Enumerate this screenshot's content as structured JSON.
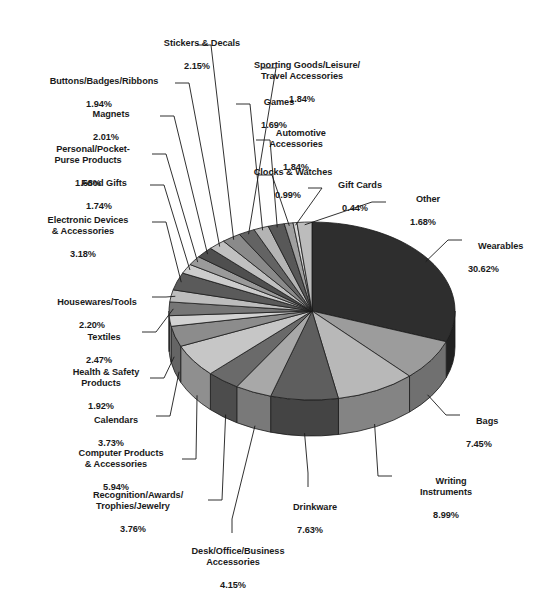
{
  "chart_data": {
    "type": "pie",
    "title": "",
    "subtitle": "",
    "xlabel": "",
    "ylabel": "",
    "legend_position": "none",
    "grid": false,
    "units": "percent",
    "start_angle_deg": 0,
    "direction": "clockwise",
    "three_d": true,
    "categories": [
      "Wearables",
      "Bags",
      "Writing Instruments",
      "Drinkware",
      "Desk/Office/Business Accessories",
      "Recognition/Awards/Trophies/Jewelry",
      "Computer Products & Accessories",
      "Calendars",
      "Health & Safety Products",
      "Textiles",
      "Housewares/Tools",
      "Electronic Devices & Accessories",
      "Food Gifts",
      "Personal/Pocket-Purse Products",
      "Magnets",
      "Buttons/Badges/Ribbons",
      "Stickers & Decals",
      "Sporting Goods/Leisure/Travel Accessories",
      "Games",
      "Automotive Accessories",
      "Clocks & Watches",
      "Gift Cards",
      "Other"
    ],
    "values": [
      30.62,
      7.45,
      8.99,
      7.63,
      4.15,
      3.76,
      5.94,
      3.73,
      1.92,
      2.47,
      2.2,
      3.18,
      1.74,
      1.68,
      2.01,
      1.94,
      2.15,
      1.84,
      1.69,
      1.84,
      0.99,
      0.44,
      1.68
    ],
    "colors": [
      "#2e2e2e",
      "#9c9c9c",
      "#b8b8b8",
      "#5e5e5e",
      "#a8a8a8",
      "#6a6a6a",
      "#c6c6c6",
      "#8c8c8c",
      "#d2d2d2",
      "#767676",
      "#bdbdbd",
      "#5a5a5a",
      "#cccccc",
      "#9a9a9a",
      "#4f4f4f",
      "#c0c0c0",
      "#8a8a8a",
      "#636363",
      "#b4b4b4",
      "#585858",
      "#a0a0a0",
      "#d6d6d6",
      "#bcbcbc"
    ]
  },
  "labels": [
    {
      "name": "stickers-decals",
      "title": "Stickers & Decals",
      "pct": "2.15%"
    },
    {
      "name": "sporting-goods",
      "title": "Sporting Goods/Leisure/\nTravel Accessories",
      "pct": "1.84%"
    },
    {
      "name": "buttons-badges",
      "title": "Buttons/Badges/Ribbons",
      "pct": "1.94%"
    },
    {
      "name": "games",
      "title": "Games",
      "pct": "1.69%"
    },
    {
      "name": "magnets",
      "title": "Magnets",
      "pct": "2.01%"
    },
    {
      "name": "automotive",
      "title": "Automotive\nAccessories",
      "pct": "1.84%"
    },
    {
      "name": "personal-pocket",
      "title": "Personal/Pocket-\nPurse Products",
      "pct": "1.68%"
    },
    {
      "name": "clocks-watches",
      "title": "Clocks & Watches",
      "pct": "0.99%"
    },
    {
      "name": "gift-cards",
      "title": "Gift Cards",
      "pct": "0.44%"
    },
    {
      "name": "other",
      "title": "Other",
      "pct": "1.68%"
    },
    {
      "name": "food-gifts",
      "title": "Food Gifts",
      "pct": "1.74%"
    },
    {
      "name": "electronic-devices",
      "title": "Electronic Devices\n& Accessories",
      "pct": "3.18%"
    },
    {
      "name": "wearables",
      "title": "Wearables",
      "pct": "30.62%"
    },
    {
      "name": "housewares-tools",
      "title": "Housewares/Tools",
      "pct": "2.20%"
    },
    {
      "name": "textiles",
      "title": "Textiles",
      "pct": "2.47%"
    },
    {
      "name": "health-safety",
      "title": "Health & Safety\nProducts",
      "pct": "1.92%"
    },
    {
      "name": "calendars",
      "title": "Calendars",
      "pct": "3.73%"
    },
    {
      "name": "bags",
      "title": "Bags",
      "pct": "7.45%"
    },
    {
      "name": "computer-products",
      "title": "Computer Products\n& Accessories",
      "pct": "5.94%"
    },
    {
      "name": "recognition-awards",
      "title": "Recognition/Awards/\nTrophies/Jewelry",
      "pct": "3.76%"
    },
    {
      "name": "writing-instruments",
      "title": "Writing\nInstruments",
      "pct": "8.99%"
    },
    {
      "name": "drinkware",
      "title": "Drinkware",
      "pct": "7.63%"
    },
    {
      "name": "desk-office",
      "title": "Desk/Office/Business\nAccessories",
      "pct": "4.15%"
    }
  ],
  "geometry": {
    "cx": 312,
    "cy": 311,
    "rx": 143,
    "ry": 89,
    "depth": 36
  },
  "leader_color": "#1a1a1a"
}
